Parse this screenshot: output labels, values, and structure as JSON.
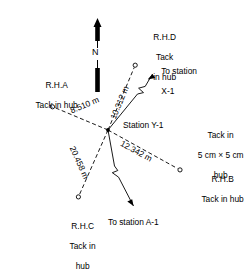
{
  "diagram": {
    "north_label": "N",
    "center_station": {
      "name": "Station Y-1",
      "note_line1": "Tack in",
      "note_line2": "5 cm × 5 cm",
      "note_line3": "hub"
    },
    "reference_hubs": [
      {
        "id": "rh-a",
        "label_line1": "R.H.",
        "label_italic": "A",
        "label_line2": "Tack in hub",
        "distance": "8.510 m"
      },
      {
        "id": "rh-b",
        "label_line1": "R.H.",
        "label_italic": "B",
        "label_line2": "Tack in hub",
        "distance": "12.342 m"
      },
      {
        "id": "rh-c",
        "label_line1": "R.H.",
        "label_italic": "C",
        "label_line2": "Tack in",
        "label_line3": "hub",
        "distance": "20.458 m"
      },
      {
        "id": "rh-d",
        "label_line1": "R.H.",
        "label_italic": "D",
        "label_line2": "Tack",
        "label_line3": "in hub",
        "distance": "10.312 m"
      }
    ],
    "sight_lines": [
      {
        "id": "to-x1",
        "line1": "To station",
        "line2": "X-1"
      },
      {
        "id": "to-a1",
        "line1": "To station A-1"
      }
    ],
    "colors": {
      "ink": "#000000",
      "background": "#ffffff"
    }
  }
}
